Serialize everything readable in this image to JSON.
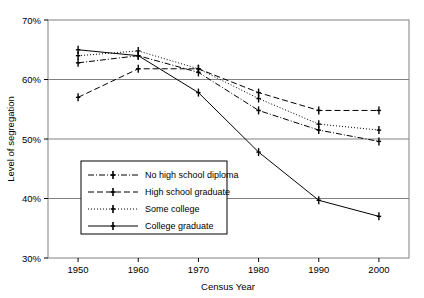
{
  "chart_data": {
    "type": "line",
    "title": "",
    "xlabel": "Census Year",
    "ylabel": "Level of segregation",
    "x": [
      1950,
      1960,
      1970,
      1980,
      1990,
      2000
    ],
    "xtick_labels": [
      "1950",
      "1960",
      "1970",
      "1980",
      "1990",
      "2000"
    ],
    "ytick_labels": [
      "30%",
      "40%",
      "50%",
      "60%",
      "70%"
    ],
    "ytick_values": [
      30,
      40,
      50,
      60,
      70
    ],
    "ylim": [
      30,
      70
    ],
    "xlim": [
      1945,
      2005
    ],
    "grid": "horizontal",
    "legend_position": "lower-left-inside",
    "series": [
      {
        "name": "No high school diploma",
        "style": "dashdot",
        "marker": "plus",
        "values": [
          62.8,
          64.0,
          61.2,
          54.8,
          51.5,
          49.6
        ]
      },
      {
        "name": "High school graduate",
        "style": "dashed",
        "marker": "plus",
        "values": [
          57.0,
          61.8,
          61.8,
          57.8,
          54.8,
          54.8
        ]
      },
      {
        "name": "Some college",
        "style": "dotted",
        "marker": "plus",
        "values": [
          64.0,
          64.8,
          61.8,
          56.8,
          52.5,
          51.5
        ]
      },
      {
        "name": "College graduate",
        "style": "solid",
        "marker": "plus",
        "values": [
          65.0,
          64.0,
          57.8,
          47.8,
          39.7,
          37.0
        ]
      }
    ]
  },
  "axes": {
    "x_title": "Census Year",
    "y_title": "Level of segregation"
  },
  "legend": {
    "entries": [
      {
        "label": "No high school diploma"
      },
      {
        "label": "High school graduate"
      },
      {
        "label": "Some college"
      },
      {
        "label": "College graduate"
      }
    ]
  },
  "colors": {
    "line": "#000000",
    "grid": "#808080",
    "frame": "#808080",
    "background": "#ffffff"
  }
}
